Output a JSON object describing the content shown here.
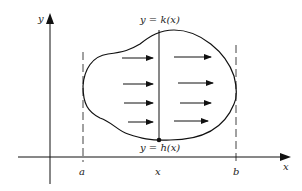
{
  "diagram": {
    "axes": {
      "x_label": "x",
      "y_label": "y"
    },
    "curves": {
      "upper_label": "y = k(x)",
      "lower_label": "y = h(x)"
    },
    "bounds": {
      "a_label": "a",
      "b_label": "b"
    },
    "slice": {
      "x_label": "x"
    },
    "arrows": {
      "count": 8,
      "direction": "right",
      "rows": 4,
      "columns": 2
    },
    "colors": {
      "stroke": "#111111",
      "background": "#ffffff"
    }
  }
}
